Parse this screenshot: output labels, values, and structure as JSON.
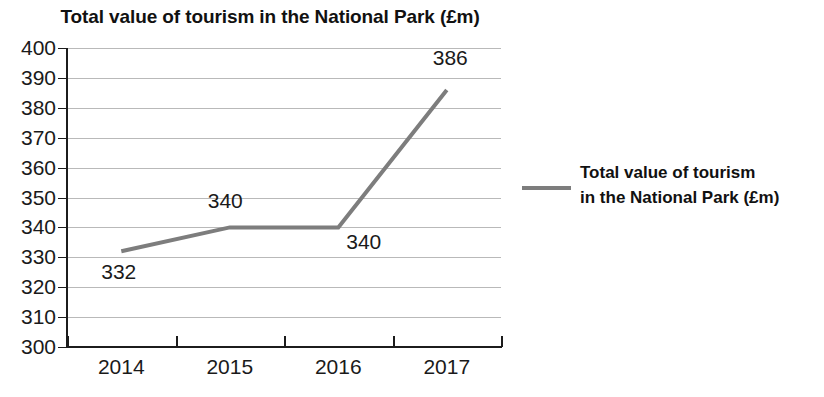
{
  "chart_data": {
    "type": "line",
    "title": "Total value of tourism in the National Park (£m)",
    "xlabel": "",
    "ylabel": "",
    "categories": [
      "2014",
      "2015",
      "2016",
      "2017"
    ],
    "values": [
      332,
      340,
      340,
      386
    ],
    "point_labels": [
      "332",
      "340",
      "340",
      "386"
    ],
    "series": [
      {
        "name": "Total value of tourism in the National Park (£m)",
        "values": [
          332,
          340,
          340,
          386
        ],
        "color": "#7d7d7d"
      }
    ],
    "ylim": [
      300,
      400
    ],
    "ytick_step": 10,
    "yticks": [
      "400",
      "390",
      "380",
      "370",
      "360",
      "350",
      "340",
      "330",
      "320",
      "310",
      "300"
    ],
    "grid": true,
    "grid_color": "#b9b9b9",
    "legend_position": "right",
    "legend": {
      "line1": "Total value of tourism",
      "line2": "in the National Park (£m)"
    }
  },
  "colors": {
    "series": "#7d7d7d",
    "axis": "#1c1c1c",
    "grid": "#b9b9b9",
    "text": "#1a1a1a",
    "background": "#ffffff"
  }
}
